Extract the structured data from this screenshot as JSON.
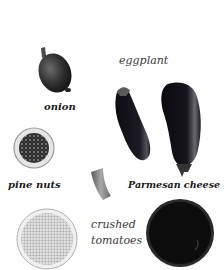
{
  "ingredients": {
    "onion": {
      "label": "onion"
    },
    "eggplant": {
      "label": "eggplant"
    },
    "pine_nuts": {
      "label": "pine nuts"
    },
    "parmesan": {
      "label": "Parmesan cheese"
    },
    "crushed_tomatoes": {
      "label_line1": "crushed",
      "label_line2": "tomatoes"
    }
  },
  "colors": {
    "background": "#ffffff",
    "text": "#1a1a1a",
    "eggplant": "#121018",
    "onion": "#2e2e2e",
    "tomato_bowl": "#0d0d0d",
    "rice_bowl": "#d9d9d9"
  }
}
